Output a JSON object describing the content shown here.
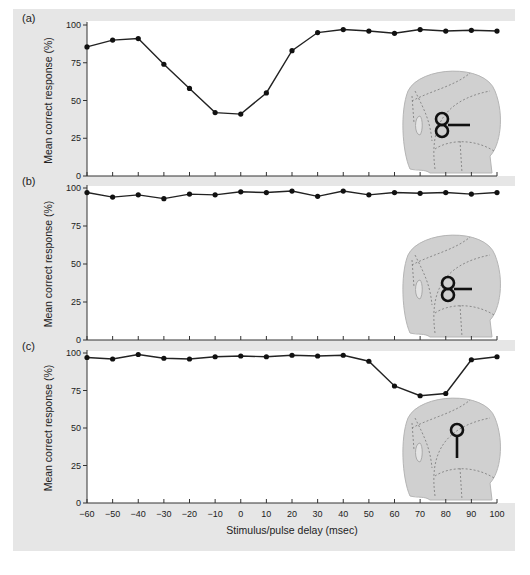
{
  "figure": {
    "xlabel": "Stimulus/pulse delay (msec)",
    "ylabel": "Mean correct response (%)",
    "panels": [
      {
        "label": "(a)",
        "coil": "figure-eight-horizontal-lower"
      },
      {
        "label": "(b)",
        "coil": "figure-eight-horizontal-middle"
      },
      {
        "label": "(c)",
        "coil": "round-coil-vertical-handle"
      }
    ],
    "x_ticks": [
      "-60",
      "-50",
      "-40",
      "-30",
      "-20",
      "-10",
      "0",
      "10",
      "20",
      "30",
      "40",
      "50",
      "60",
      "70",
      "80",
      "90",
      "100"
    ],
    "y_ticks": [
      "0",
      "25",
      "50",
      "75",
      "100"
    ]
  },
  "chart_data": [
    {
      "type": "line",
      "title": "(a)",
      "xlabel": "Stimulus/pulse delay (msec)",
      "ylabel": "Mean correct response (%)",
      "x": [
        -60,
        -50,
        -40,
        -30,
        -20,
        -10,
        0,
        10,
        20,
        30,
        40,
        50,
        60,
        70,
        80,
        90,
        100
      ],
      "series": [
        {
          "name": "(a)",
          "values": [
            85.5,
            90,
            91,
            74,
            58,
            42,
            41,
            55,
            83,
            95,
            97,
            96,
            94.5,
            97,
            96,
            96.5,
            96
          ]
        }
      ],
      "xlim": [
        -60,
        100
      ],
      "ylim": [
        0,
        100
      ],
      "grid": false
    },
    {
      "type": "line",
      "title": "(b)",
      "xlabel": "Stimulus/pulse delay (msec)",
      "ylabel": "Mean correct response (%)",
      "x": [
        -60,
        -50,
        -40,
        -30,
        -20,
        -10,
        0,
        10,
        20,
        30,
        40,
        50,
        60,
        70,
        80,
        90,
        100
      ],
      "series": [
        {
          "name": "(b)",
          "values": [
            97,
            94,
            95.5,
            93,
            96,
            95.5,
            97.5,
            97,
            98,
            94.5,
            98,
            95.5,
            97,
            96.5,
            97,
            96,
            97
          ]
        }
      ],
      "xlim": [
        -60,
        100
      ],
      "ylim": [
        0,
        100
      ],
      "grid": false
    },
    {
      "type": "line",
      "title": "(c)",
      "xlabel": "Stimulus/pulse delay (msec)",
      "ylabel": "Mean correct response (%)",
      "x": [
        -60,
        -50,
        -40,
        -30,
        -20,
        -10,
        0,
        10,
        20,
        30,
        40,
        50,
        60,
        70,
        80,
        90,
        100
      ],
      "series": [
        {
          "name": "(c)",
          "values": [
            97,
            96,
            99,
            96.5,
            96,
            97.5,
            98,
            97.5,
            98.5,
            98,
            98.5,
            94.5,
            78,
            71.5,
            73,
            95.5,
            97.5
          ]
        }
      ],
      "xlim": [
        -60,
        100
      ],
      "ylim": [
        0,
        100
      ],
      "grid": false
    }
  ]
}
